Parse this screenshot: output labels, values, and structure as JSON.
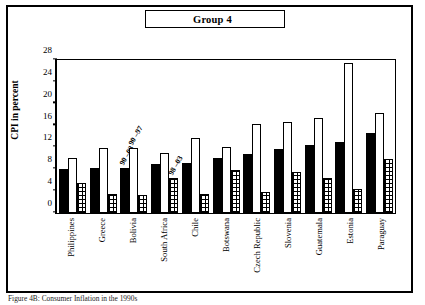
{
  "figure": {
    "title": "Group 4",
    "ylabel": "CPI in percent",
    "caption": "Figure 4B: Consumer Inflation in the 1990s"
  },
  "chart_data": {
    "type": "bar",
    "title": "Group 4",
    "xlabel": "",
    "ylabel": "CPI in percent",
    "ylim": [
      0,
      28
    ],
    "yticks": [
      "0",
      "4",
      "8",
      "12",
      "16",
      "20",
      "24",
      "28"
    ],
    "grid": false,
    "legend_position": "none",
    "categories": [
      "Philippines",
      "Greece",
      "Bolivia",
      "South Africa",
      "Chile",
      "Botswana",
      "Czech Republic",
      "Slovenia",
      "Guatemala",
      "Estonia",
      "Paraguay"
    ],
    "series": [
      {
        "name": "90",
        "style": "solid-black",
        "values": [
          8.0,
          8.1,
          8.1,
          8.8,
          9.0,
          10.0,
          10.6,
          11.5,
          12.3,
          12.9,
          14.4
        ]
      },
      {
        "name": "90 –97",
        "style": "hollow-white",
        "values": [
          10.0,
          11.8,
          11.8,
          10.8,
          13.5,
          11.9,
          16.0,
          16.5,
          17.1,
          27.1,
          18.0
        ]
      },
      {
        "name": "98 –03",
        "style": "checkered",
        "values": [
          5.5,
          3.4,
          3.3,
          6.3,
          3.5,
          7.7,
          3.8,
          7.4,
          6.4,
          4.3,
          9.8
        ]
      }
    ],
    "annotations": [
      {
        "text": "90",
        "near": "Bolivia"
      },
      {
        "text": "–03",
        "near": "Bolivia"
      },
      {
        "text": "90",
        "near": "Bolivia"
      },
      {
        "text": "–97",
        "near": "Bolivia"
      },
      {
        "text": "98",
        "near": "South Africa"
      },
      {
        "text": "–03",
        "near": "South Africa"
      }
    ]
  },
  "axis": {
    "yticks": [
      {
        "label": "28",
        "value": 28
      },
      {
        "label": "24",
        "value": 24
      },
      {
        "label": "20",
        "value": 20
      },
      {
        "label": "16",
        "value": 16
      },
      {
        "label": "12",
        "value": 12
      },
      {
        "label": "8",
        "value": 8
      },
      {
        "label": "4",
        "value": 4
      },
      {
        "label": "0",
        "value": 0
      }
    ]
  },
  "annotations": {
    "a1": "90",
    "a2": "–03",
    "a3": "90",
    "a4": "–97",
    "a5": "98",
    "a6": "–03"
  }
}
